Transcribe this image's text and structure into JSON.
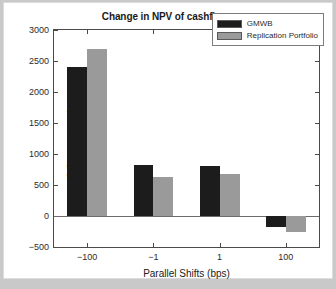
{
  "chart_data": {
    "type": "bar",
    "title": "Change in NPV of cashflows",
    "xlabel": "Parallel Shifts (bps)",
    "ylabel": "$ Change in price",
    "categories": [
      "-100",
      "-1",
      "1",
      "100"
    ],
    "series": [
      {
        "name": "GMWB",
        "color": "#1c1c1c",
        "values": [
          2400,
          830,
          810,
          -180
        ]
      },
      {
        "name": "Replication Portfolio",
        "color": "#9a9a9a",
        "values": [
          2700,
          625,
          680,
          -250
        ]
      }
    ],
    "ylim": [
      -500,
      3000
    ],
    "yticks": [
      3000,
      2500,
      2000,
      1500,
      1000,
      500,
      0,
      -500
    ],
    "ytick_labels": [
      "3000",
      "2500",
      "2000",
      "1500",
      "1000",
      "500",
      "0",
      "−500"
    ],
    "xtick_labels": [
      "−100",
      "−1",
      "1",
      "100"
    ],
    "grid": false,
    "legend_position": "top-right",
    "zero_line": 0
  }
}
